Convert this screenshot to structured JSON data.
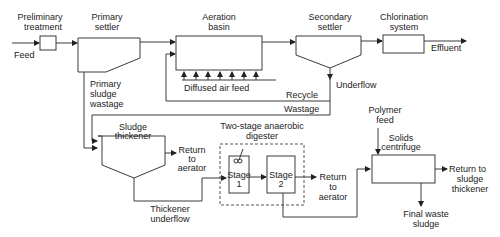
{
  "diagram": {
    "units": {
      "preliminary_treatment": [
        "Preliminary",
        "treatment"
      ],
      "primary_settler": [
        "Primary",
        "settler"
      ],
      "aeration_basin": [
        "Aeration",
        "basin"
      ],
      "secondary_settler": [
        "Secondary",
        "settler"
      ],
      "chlorination_system": [
        "Chlorination",
        "system"
      ],
      "sludge_thickener": [
        "Sludge",
        "thickener"
      ],
      "digester": [
        "Two-stage anaerobic",
        "digester"
      ],
      "stage1": [
        "Stage",
        "1"
      ],
      "stage2": [
        "Stage",
        "2"
      ],
      "solids_centrifuge": [
        "Solids",
        "centrifuge"
      ]
    },
    "streams": {
      "feed": "Feed",
      "effluent": "Effluent",
      "diffused_air": "Diffused air feed",
      "recycle": "Recycle",
      "wastage": "Wastage",
      "underflow": "Underflow",
      "primary_sludge_wastage": [
        "Primary",
        "sludge",
        "wastage"
      ],
      "return_to_aerator_1": [
        "Return",
        "to",
        "aerator"
      ],
      "return_to_aerator_2": [
        "Return",
        "to",
        "aerator"
      ],
      "thickener_underflow": [
        "Thickener",
        "underflow"
      ],
      "polymer_feed": [
        "Polymer",
        "feed"
      ],
      "return_to_thickener": [
        "Return to",
        "sludge",
        "thickener"
      ],
      "final_waste_sludge": [
        "Final waste",
        "sludge"
      ]
    },
    "colors": {
      "line": "#3a3a3a",
      "text": "#222222",
      "background": "#ffffff"
    }
  }
}
